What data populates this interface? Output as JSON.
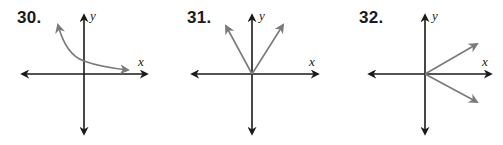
{
  "problems": [
    {
      "number": "30.",
      "x_axis_label": "x",
      "y_axis_label": "y",
      "graph": "decreasing exponential-like curve, arrow up-left and arrow toward right approaching x-axis, y-intercept above origin"
    },
    {
      "number": "31.",
      "x_axis_label": "x",
      "y_axis_label": "y",
      "graph": "V-shaped graph with vertex at origin, two rays opening upward"
    },
    {
      "number": "32.",
      "x_axis_label": "x",
      "y_axis_label": "y",
      "graph": "sideways V with vertex at origin, two rays opening to the right"
    }
  ],
  "colors": {
    "axis": "#1a1a1a",
    "graph": "#7a7a7a",
    "background": "#ffffff"
  }
}
